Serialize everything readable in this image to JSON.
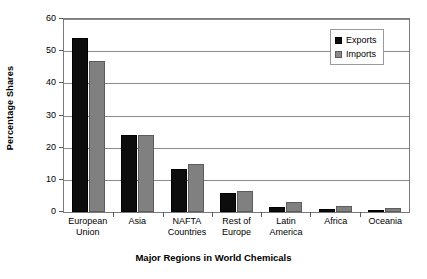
{
  "chart_data": {
    "type": "bar",
    "title": "",
    "xlabel": "Major Regions in World Chemicals",
    "ylabel": "Percentage Shares",
    "categories": [
      "European Union",
      "Asia",
      "NAFTA Countries",
      "Rest of Europe",
      "Latin America",
      "Africa",
      "Oceania"
    ],
    "category_lines": [
      [
        "European",
        "Union"
      ],
      [
        "Asia",
        ""
      ],
      [
        "NAFTA",
        "Countries"
      ],
      [
        "Rest of",
        "Europe"
      ],
      [
        "Latin",
        "America"
      ],
      [
        "Africa",
        ""
      ],
      [
        "Oceania",
        ""
      ]
    ],
    "series": [
      {
        "name": "Exports",
        "color": "#0d0d0d",
        "values": [
          54,
          24,
          13.5,
          6,
          1.5,
          0.8,
          0.5
        ]
      },
      {
        "name": "Imports",
        "color": "#808080",
        "values": [
          47,
          24,
          15,
          6.5,
          3.2,
          1.8,
          1.2
        ]
      }
    ],
    "ylim": [
      0,
      60
    ],
    "yticks": [
      0,
      10,
      20,
      30,
      40,
      50,
      60
    ],
    "ytick_labels": [
      "0",
      "10",
      "20",
      "30",
      "40",
      "50",
      "60"
    ],
    "grid": true,
    "legend_position": "top-right"
  }
}
